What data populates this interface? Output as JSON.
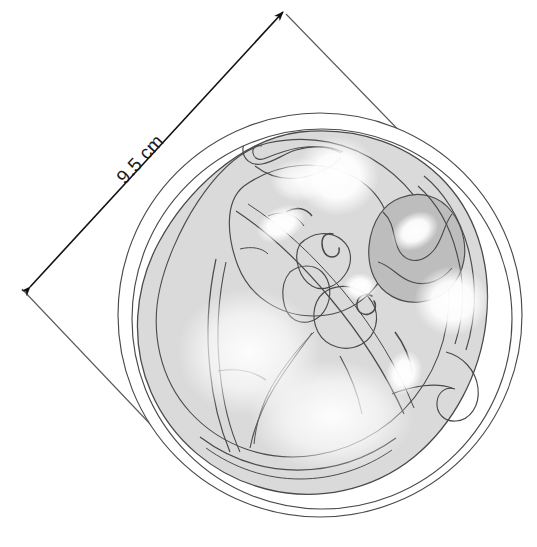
{
  "figure": {
    "background_color": "#ffffff",
    "width": 537,
    "height": 547
  },
  "dimension": {
    "label": "9.5 cm",
    "value": 9.5,
    "unit": "cm",
    "style": "double-headed-arrow",
    "rotation_degrees": -45,
    "color": "#1a1a1a",
    "arrow_start": {
      "x": 30,
      "y": 287
    },
    "arrow_end": {
      "x": 283,
      "y": 12
    },
    "label_position": {
      "x": 141,
      "y": 160
    }
  },
  "extension_lines": {
    "color": "#5a5a5a",
    "left": {
      "x1": 22,
      "y1": 289,
      "x2": 190,
      "y2": 466
    },
    "right": {
      "x1": 286,
      "y1": 14,
      "x2": 447,
      "y2": 180
    }
  },
  "shapes": {
    "outer_circle": {
      "name": "amniotic-sac-outer-wall",
      "cx": 320,
      "cy": 315,
      "r": 202,
      "stroke": "#4a4a4a",
      "fill": "none"
    },
    "inner_circle": {
      "name": "amniotic-sac-inner-wall",
      "cx": 322,
      "cy": 319,
      "r": 190,
      "stroke": "#4a4a4a",
      "fill": "none"
    },
    "body_mass": {
      "name": "fetal-body-mass",
      "fill": "#dadada",
      "stroke": "#4a4a4a"
    },
    "dark_region": {
      "name": "shaded-organ-region",
      "fill": "#bdbdbd",
      "stroke": "#4a4a4a"
    }
  },
  "colors": {
    "line": "#3c3c3c",
    "line_light": "#5a5a5a",
    "fill_light": "#dadada",
    "fill_medium": "#c6c6c6",
    "fill_dark": "#b4b4b4",
    "highlight": "#ffffff",
    "background": "#ffffff",
    "text": "#1a1a1a"
  },
  "highlights": [
    {
      "name": "highlight-upper-center",
      "cx": 337,
      "cy": 176,
      "rx": 36,
      "ry": 36
    },
    {
      "name": "highlight-left-oval",
      "cx": 281,
      "cy": 224,
      "rx": 22,
      "ry": 15
    },
    {
      "name": "highlight-right-oval",
      "cx": 415,
      "cy": 231,
      "rx": 22,
      "ry": 16
    },
    {
      "name": "highlight-mid-small",
      "cx": 362,
      "cy": 287,
      "rx": 14,
      "ry": 12
    },
    {
      "name": "highlight-right-round",
      "cx": 450,
      "cy": 301,
      "rx": 33,
      "ry": 31
    },
    {
      "name": "highlight-lower-oval",
      "cx": 404,
      "cy": 373,
      "rx": 16,
      "ry": 20
    },
    {
      "name": "highlight-lower-left",
      "cx": 251,
      "cy": 354,
      "rx": 70,
      "ry": 62
    },
    {
      "name": "highlight-bottom-broad",
      "cx": 330,
      "cy": 420,
      "rx": 80,
      "ry": 55
    }
  ]
}
